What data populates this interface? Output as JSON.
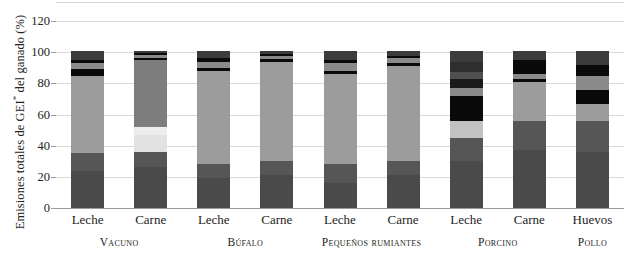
{
  "chart_data": {
    "type": "bar",
    "title": "",
    "subtitle": "",
    "xlabel": "",
    "ylabel": "Emisiones totales de GEI* del ganado (%)",
    "ylabel_parts": {
      "pre": "Emisiones totales de GEI",
      "sup": "*",
      "post": " del ganado (%)"
    },
    "ylim": [
      0,
      120
    ],
    "yticks": [
      0,
      20,
      40,
      60,
      80,
      100,
      120
    ],
    "ytick_labels": [
      "0",
      "20",
      "40",
      "60",
      "80",
      "100",
      "120"
    ],
    "grid": true,
    "legend": "none",
    "stacked": true,
    "stack_total": 100,
    "units": "%",
    "categories": [
      "Leche",
      "Carne",
      "Leche",
      "Carne",
      "Leche",
      "Carne",
      "Leche",
      "Carne",
      "Huevos"
    ],
    "groups": [
      {
        "label": "Vacuno",
        "bars": [
          0,
          1
        ]
      },
      {
        "label": "Búfalo",
        "bars": [
          2,
          3
        ]
      },
      {
        "label": "Pequeños rumiantes",
        "bars": [
          4,
          5
        ]
      },
      {
        "label": "Porcino",
        "bars": [
          6,
          7
        ]
      },
      {
        "label": "Pollo",
        "bars": [
          8
        ]
      }
    ],
    "series": [
      {
        "name": "segment-1",
        "color": "#4a4a4a",
        "values": [
          24,
          26,
          19,
          21,
          16,
          21,
          30,
          37,
          36
        ]
      },
      {
        "name": "segment-2",
        "color": "#565656",
        "values": [
          11,
          10,
          9,
          9,
          12,
          9,
          15,
          19,
          20
        ]
      },
      {
        "name": "segment-3",
        "color": "#9c9c9c",
        "values": [
          50,
          16,
          60,
          64,
          58,
          61,
          10,
          25,
          11
        ]
      },
      {
        "name": "segment-4",
        "color": "#e2e2e2",
        "values": [
          0,
          11,
          0,
          0,
          0,
          0,
          11,
          0,
          0
        ]
      },
      {
        "name": "segment-5",
        "color": "#7d7d7d",
        "values": [
          0,
          32,
          0,
          0,
          0,
          0,
          0,
          0,
          0
        ]
      },
      {
        "name": "segment-6",
        "color": "#0a0a0a",
        "values": [
          4,
          1,
          2,
          1,
          2,
          2,
          16,
          2,
          11
        ]
      },
      {
        "name": "segment-7",
        "color": "#8a8a8a",
        "values": [
          4,
          1,
          4,
          2,
          5,
          3,
          5,
          3,
          9
        ]
      },
      {
        "name": "segment-8",
        "color": "#0a0a0a",
        "values": [
          1,
          1,
          1,
          1,
          2,
          1,
          6,
          10,
          7
        ]
      },
      {
        "name": "segment-9",
        "color": "#3c3c3c",
        "values": [
          6,
          2,
          5,
          2,
          5,
          3,
          7,
          4,
          6
        ]
      }
    ],
    "bar_segments": [
      {
        "bar": 0,
        "label": "Leche",
        "group": "Vacuno",
        "segments": [
          {
            "from": 0,
            "to": 24,
            "color": "#4a4a4a"
          },
          {
            "from": 24,
            "to": 35,
            "color": "#565656"
          },
          {
            "from": 35,
            "to": 85,
            "color": "#9c9c9c"
          },
          {
            "from": 85,
            "to": 89,
            "color": "#0a0a0a"
          },
          {
            "from": 89,
            "to": 93,
            "color": "#8a8a8a"
          },
          {
            "from": 93,
            "to": 95,
            "color": "#0a0a0a"
          },
          {
            "from": 95,
            "to": 101,
            "color": "#3c3c3c"
          }
        ]
      },
      {
        "bar": 1,
        "label": "Carne",
        "group": "Vacuno",
        "segments": [
          {
            "from": 0,
            "to": 26,
            "color": "#4a4a4a"
          },
          {
            "from": 26,
            "to": 36,
            "color": "#565656"
          },
          {
            "from": 36,
            "to": 47,
            "color": "#e2e2e2"
          },
          {
            "from": 47,
            "to": 52,
            "color": "#ededed"
          },
          {
            "from": 52,
            "to": 95,
            "color": "#7d7d7d"
          },
          {
            "from": 95,
            "to": 96.5,
            "color": "#0a0a0a"
          },
          {
            "from": 96.5,
            "to": 98,
            "color": "#8a8a8a"
          },
          {
            "from": 98,
            "to": 99.5,
            "color": "#0a0a0a"
          },
          {
            "from": 99.5,
            "to": 101,
            "color": "#3c3c3c"
          }
        ]
      },
      {
        "bar": 2,
        "label": "Leche",
        "group": "Búfalo",
        "segments": [
          {
            "from": 0,
            "to": 19,
            "color": "#4a4a4a"
          },
          {
            "from": 19,
            "to": 28,
            "color": "#565656"
          },
          {
            "from": 28,
            "to": 88,
            "color": "#9c9c9c"
          },
          {
            "from": 88,
            "to": 90,
            "color": "#0a0a0a"
          },
          {
            "from": 90,
            "to": 94,
            "color": "#8a8a8a"
          },
          {
            "from": 94,
            "to": 96,
            "color": "#0a0a0a"
          },
          {
            "from": 96,
            "to": 101,
            "color": "#3c3c3c"
          }
        ]
      },
      {
        "bar": 3,
        "label": "Carne",
        "group": "Búfalo",
        "segments": [
          {
            "from": 0,
            "to": 21,
            "color": "#4a4a4a"
          },
          {
            "from": 21,
            "to": 30,
            "color": "#565656"
          },
          {
            "from": 30,
            "to": 94,
            "color": "#9c9c9c"
          },
          {
            "from": 94,
            "to": 95.5,
            "color": "#0a0a0a"
          },
          {
            "from": 95.5,
            "to": 97.5,
            "color": "#8a8a8a"
          },
          {
            "from": 97.5,
            "to": 99,
            "color": "#0a0a0a"
          },
          {
            "from": 99,
            "to": 101,
            "color": "#3c3c3c"
          }
        ]
      },
      {
        "bar": 4,
        "label": "Leche",
        "group": "Pequeños rumiantes",
        "segments": [
          {
            "from": 0,
            "to": 16,
            "color": "#4a4a4a"
          },
          {
            "from": 16,
            "to": 28,
            "color": "#565656"
          },
          {
            "from": 28,
            "to": 86,
            "color": "#9c9c9c"
          },
          {
            "from": 86,
            "to": 88,
            "color": "#0a0a0a"
          },
          {
            "from": 88,
            "to": 93,
            "color": "#8a8a8a"
          },
          {
            "from": 93,
            "to": 95,
            "color": "#0a0a0a"
          },
          {
            "from": 95,
            "to": 101,
            "color": "#3c3c3c"
          }
        ]
      },
      {
        "bar": 5,
        "label": "Carne",
        "group": "Pequeños rumiantes",
        "segments": [
          {
            "from": 0,
            "to": 21,
            "color": "#4a4a4a"
          },
          {
            "from": 21,
            "to": 30,
            "color": "#565656"
          },
          {
            "from": 30,
            "to": 91,
            "color": "#9c9c9c"
          },
          {
            "from": 91,
            "to": 93,
            "color": "#0a0a0a"
          },
          {
            "from": 93,
            "to": 96,
            "color": "#8a8a8a"
          },
          {
            "from": 96,
            "to": 97.5,
            "color": "#0a0a0a"
          },
          {
            "from": 97.5,
            "to": 101,
            "color": "#3c3c3c"
          }
        ]
      },
      {
        "bar": 6,
        "label": "Leche",
        "group": "Porcino",
        "segments": [
          {
            "from": 0,
            "to": 30,
            "color": "#4a4a4a"
          },
          {
            "from": 30,
            "to": 45,
            "color": "#565656"
          },
          {
            "from": 45,
            "to": 56,
            "color": "#c2c2c2"
          },
          {
            "from": 56,
            "to": 72,
            "color": "#0a0a0a"
          },
          {
            "from": 72,
            "to": 77,
            "color": "#8a8a8a"
          },
          {
            "from": 77,
            "to": 83,
            "color": "#1a1a1a"
          },
          {
            "from": 83,
            "to": 87,
            "color": "#4f4f4f"
          },
          {
            "from": 87,
            "to": 94,
            "color": "#2e2e2e"
          },
          {
            "from": 94,
            "to": 101,
            "color": "#3c3c3c"
          }
        ]
      },
      {
        "bar": 7,
        "label": "Carne",
        "group": "Porcino",
        "segments": [
          {
            "from": 0,
            "to": 37,
            "color": "#4a4a4a"
          },
          {
            "from": 37,
            "to": 56,
            "color": "#565656"
          },
          {
            "from": 56,
            "to": 81,
            "color": "#9c9c9c"
          },
          {
            "from": 81,
            "to": 83,
            "color": "#0a0a0a"
          },
          {
            "from": 83,
            "to": 86,
            "color": "#8a8a8a"
          },
          {
            "from": 86,
            "to": 95,
            "color": "#0a0a0a"
          },
          {
            "from": 95,
            "to": 101,
            "color": "#3c3c3c"
          }
        ]
      },
      {
        "bar": 8,
        "label": "Huevos",
        "group": "Pollo",
        "segments": [
          {
            "from": 0,
            "to": 36,
            "color": "#4a4a4a"
          },
          {
            "from": 36,
            "to": 56,
            "color": "#565656"
          },
          {
            "from": 56,
            "to": 67,
            "color": "#9c9c9c"
          },
          {
            "from": 67,
            "to": 76,
            "color": "#0a0a0a"
          },
          {
            "from": 76,
            "to": 85,
            "color": "#8a8a8a"
          },
          {
            "from": 85,
            "to": 92,
            "color": "#0a0a0a"
          },
          {
            "from": 92,
            "to": 101,
            "color": "#3c3c3c"
          }
        ]
      }
    ]
  },
  "axis": {
    "y_title_pre": "Emisiones totales de GEI",
    "y_title_sup": "*",
    "y_title_post": " del ganado (%)"
  }
}
